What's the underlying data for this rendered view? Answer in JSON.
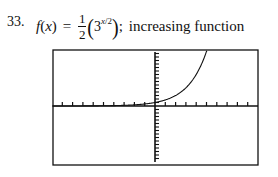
{
  "problem": {
    "number": "33.",
    "function_name": "f",
    "variable": "x",
    "equals": "=",
    "coefficient_numerator": "1",
    "coefficient_denominator": "2",
    "base": "3",
    "exponent_var": "x",
    "exponent_slash": "/",
    "exponent_den": "2",
    "separator": ";",
    "description": "increasing function"
  },
  "chart_data": {
    "type": "line",
    "title": "",
    "function": "f(x) = (1/2)(3^(x/2))",
    "xlabel": "",
    "ylabel": "",
    "xlim": [
      -10,
      10
    ],
    "ylim": [
      -8,
      8
    ],
    "xscl": 1,
    "yscl": 0.5,
    "grid": false,
    "legend": null,
    "series": [
      {
        "name": "f(x)",
        "x": [
          -10,
          -8,
          -6,
          -4,
          -2,
          0,
          1,
          2,
          3,
          4,
          5,
          5.4
        ],
        "y": [
          0.002,
          0.006,
          0.019,
          0.056,
          0.167,
          0.5,
          0.866,
          1.5,
          2.598,
          4.5,
          7.794,
          9.7
        ]
      }
    ]
  },
  "plot_frame": {
    "left": 53,
    "top": 50,
    "right": 258,
    "bottom": 165,
    "axis_x_px": 155,
    "axis_y_px": 106,
    "stroke": "#111111"
  }
}
